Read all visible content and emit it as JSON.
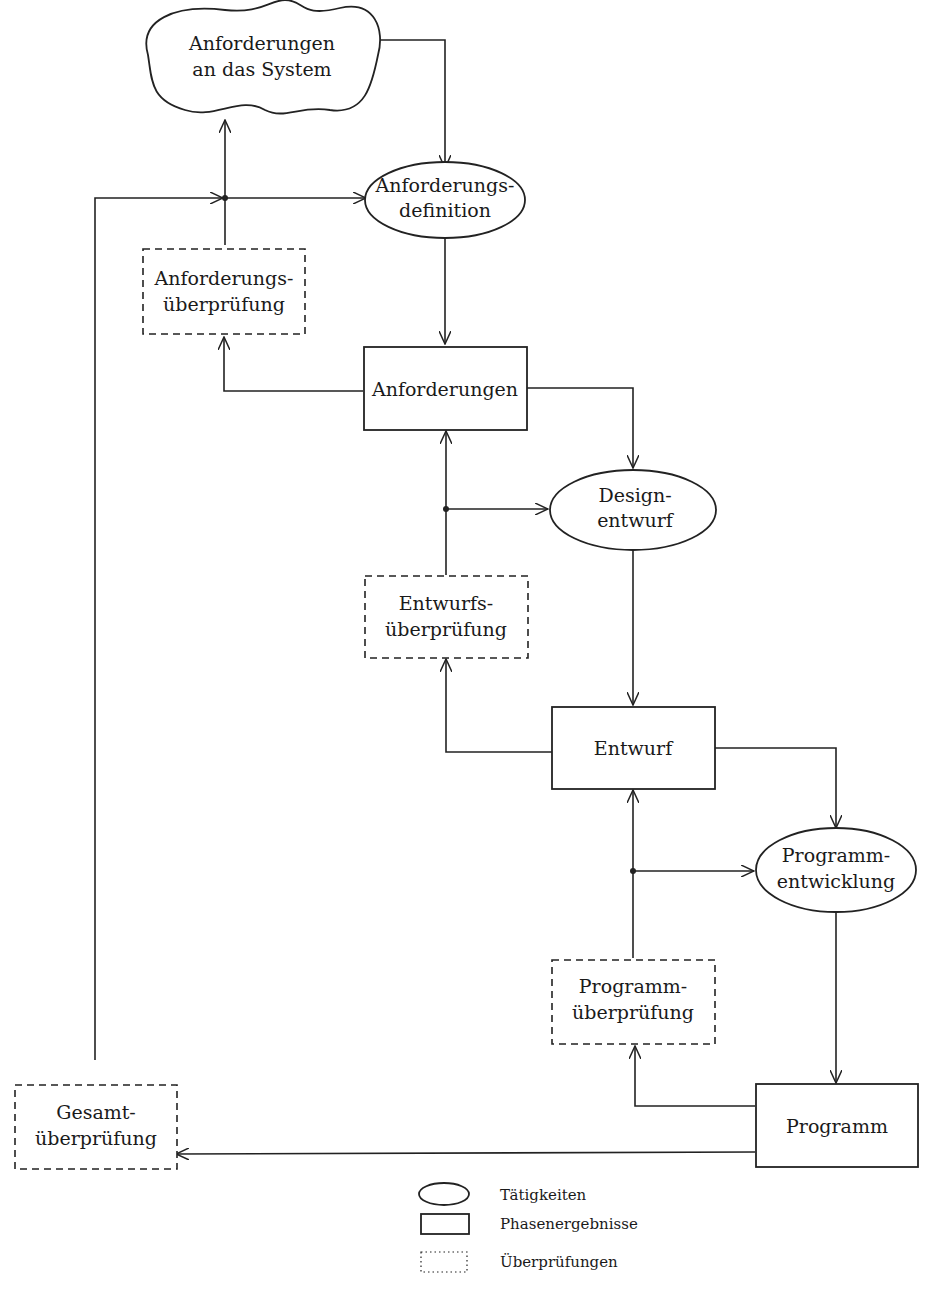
{
  "diagram": {
    "nodes": {
      "cloud": {
        "type": "cloud",
        "lines": [
          "Anforderungen",
          "an das System"
        ]
      },
      "anf_def": {
        "type": "activity",
        "lines": [
          "Anforderungs-",
          "definition"
        ]
      },
      "anf_check": {
        "type": "review",
        "lines": [
          "Anforderungs-",
          "überprüfung"
        ]
      },
      "anf": {
        "type": "result",
        "lines": [
          "Anforderungen"
        ]
      },
      "design": {
        "type": "activity",
        "lines": [
          "Design-",
          "entwurf"
        ]
      },
      "ent_check": {
        "type": "review",
        "lines": [
          "Entwurfs-",
          "überprüfung"
        ]
      },
      "entwurf": {
        "type": "result",
        "lines": [
          "Entwurf"
        ]
      },
      "prog_dev": {
        "type": "activity",
        "lines": [
          "Programm-",
          "entwicklung"
        ]
      },
      "prog_check": {
        "type": "review",
        "lines": [
          "Programm-",
          "überprüfung"
        ]
      },
      "programm": {
        "type": "result",
        "lines": [
          "Programm"
        ]
      },
      "gesamt": {
        "type": "review",
        "lines": [
          "Gesamt-",
          "überprüfung"
        ]
      }
    },
    "edges": [
      [
        "cloud",
        "anf_def"
      ],
      [
        "anf_def",
        "anf"
      ],
      [
        "anf",
        "anf_check"
      ],
      [
        "anf_check",
        "cloud"
      ],
      [
        "anf_check",
        "anf_def"
      ],
      [
        "anf",
        "design"
      ],
      [
        "design",
        "entwurf"
      ],
      [
        "entwurf",
        "ent_check"
      ],
      [
        "ent_check",
        "anf"
      ],
      [
        "ent_check",
        "design"
      ],
      [
        "entwurf",
        "prog_dev"
      ],
      [
        "prog_dev",
        "programm"
      ],
      [
        "programm",
        "prog_check"
      ],
      [
        "prog_check",
        "entwurf"
      ],
      [
        "prog_check",
        "prog_dev"
      ],
      [
        "programm",
        "gesamt"
      ],
      [
        "gesamt",
        "anf_def"
      ]
    ],
    "legend": [
      {
        "shape": "ellipse",
        "label": "Tätigkeiten"
      },
      {
        "shape": "rect",
        "label": "Phasenergebnisse"
      },
      {
        "shape": "dotted-rect",
        "label": "Überprüfungen"
      }
    ]
  }
}
